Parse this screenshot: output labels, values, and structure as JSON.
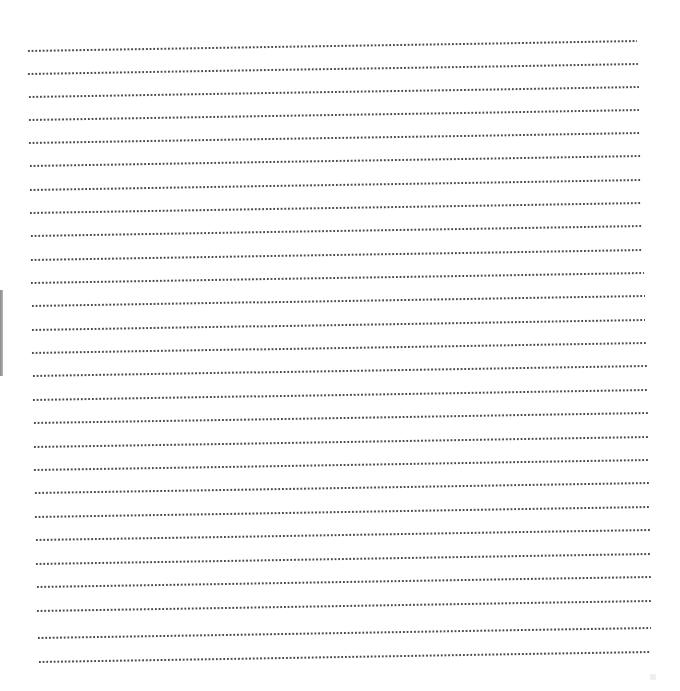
{
  "document": {
    "type": "blank dotted-line writing sheet",
    "line_count": 27,
    "line_color": "#4a4a4a",
    "background_color": "#ffffff",
    "edge_bar_color": "#9a9a9a",
    "lines": [
      {
        "x": 27,
        "y": 51,
        "w": 610
      },
      {
        "x": 27,
        "y": 74,
        "w": 611
      },
      {
        "x": 28,
        "y": 97,
        "w": 611
      },
      {
        "x": 28,
        "y": 120,
        "w": 611
      },
      {
        "x": 28,
        "y": 143,
        "w": 612
      },
      {
        "x": 29,
        "y": 166,
        "w": 612
      },
      {
        "x": 29,
        "y": 190,
        "w": 612
      },
      {
        "x": 29,
        "y": 213,
        "w": 613
      },
      {
        "x": 30,
        "y": 236,
        "w": 613
      },
      {
        "x": 30,
        "y": 260,
        "w": 613
      },
      {
        "x": 30,
        "y": 283,
        "w": 614
      },
      {
        "x": 31,
        "y": 306,
        "w": 614
      },
      {
        "x": 31,
        "y": 330,
        "w": 614
      },
      {
        "x": 31,
        "y": 353,
        "w": 615
      },
      {
        "x": 32,
        "y": 376,
        "w": 615
      },
      {
        "x": 32,
        "y": 400,
        "w": 615
      },
      {
        "x": 33,
        "y": 423,
        "w": 615
      },
      {
        "x": 33,
        "y": 447,
        "w": 616
      },
      {
        "x": 33,
        "y": 470,
        "w": 616
      },
      {
        "x": 34,
        "y": 493,
        "w": 616
      },
      {
        "x": 34,
        "y": 517,
        "w": 616
      },
      {
        "x": 35,
        "y": 540,
        "w": 616
      },
      {
        "x": 35,
        "y": 564,
        "w": 616
      },
      {
        "x": 36,
        "y": 587,
        "w": 615
      },
      {
        "x": 36,
        "y": 611,
        "w": 615
      },
      {
        "x": 37,
        "y": 638,
        "w": 614
      },
      {
        "x": 38,
        "y": 662,
        "w": 613
      }
    ]
  }
}
